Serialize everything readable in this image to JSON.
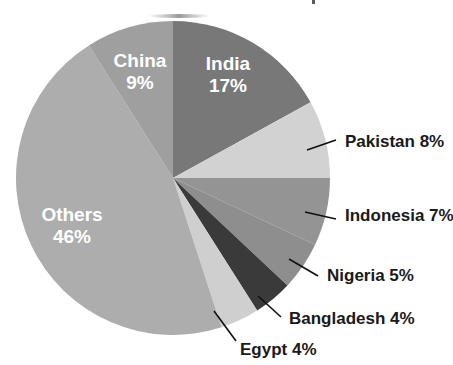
{
  "chart_data": {
    "type": "pie",
    "title": "",
    "xlabel": "",
    "ylabel": "",
    "legend_position": "none",
    "grid": false,
    "units": "percent",
    "start_angle_deg": 0,
    "direction": "clockwise",
    "categories": [
      "India",
      "Pakistan",
      "Indonesia",
      "Nigeria",
      "Bangladesh",
      "Egypt",
      "Others",
      "China"
    ],
    "values": [
      17,
      8,
      7,
      5,
      4,
      4,
      46,
      9
    ],
    "total": 100,
    "slices": [
      {
        "name": "India",
        "value": 17,
        "label": "India",
        "value_label": "17%",
        "color": "#787878",
        "label_placement": "inside",
        "label_color": "#ffffff",
        "start_deg": 0,
        "end_deg": 61.2,
        "leader_line": false
      },
      {
        "name": "Pakistan",
        "value": 8,
        "label": "Pakistan 8%",
        "value_label": "8%",
        "color": "#d2d2d2",
        "label_placement": "outside",
        "label_color": "#1a1a1a",
        "start_deg": 61.2,
        "end_deg": 90.0,
        "leader_line": true
      },
      {
        "name": "Indonesia",
        "value": 7,
        "label": "Indonesia 7%",
        "value_label": "7%",
        "color": "#949494",
        "label_placement": "outside",
        "label_color": "#1a1a1a",
        "start_deg": 90.0,
        "end_deg": 115.2,
        "leader_line": true
      },
      {
        "name": "Nigeria",
        "value": 5,
        "label": "Nigeria 5%",
        "value_label": "5%",
        "color": "#8e8e8e",
        "label_placement": "outside",
        "label_color": "#1a1a1a",
        "start_deg": 115.2,
        "end_deg": 133.2,
        "leader_line": true
      },
      {
        "name": "Bangladesh",
        "value": 4,
        "label": "Bangladesh 4%",
        "value_label": "4%",
        "color": "#3a3a3a",
        "label_placement": "outside",
        "label_color": "#1a1a1a",
        "start_deg": 133.2,
        "end_deg": 147.6,
        "leader_line": true
      },
      {
        "name": "Egypt",
        "value": 4,
        "label": "Egypt 4%",
        "value_label": "4%",
        "color": "#cfcfcf",
        "label_placement": "outside",
        "label_color": "#1a1a1a",
        "start_deg": 147.6,
        "end_deg": 162.0,
        "leader_line": true
      },
      {
        "name": "Others",
        "value": 46,
        "label": "Others",
        "value_label": "46%",
        "color": "#adadad",
        "label_placement": "inside",
        "label_color": "#ffffff",
        "start_deg": 162.0,
        "end_deg": 327.6,
        "leader_line": false
      },
      {
        "name": "China",
        "value": 9,
        "label": "China",
        "value_label": "9%",
        "color": "#9f9f9f",
        "label_placement": "inside",
        "label_color": "#ffffff",
        "start_deg": 327.6,
        "end_deg": 360.0,
        "leader_line": false
      }
    ]
  },
  "inner_labels": [
    {
      "name": "india",
      "line1": "India",
      "line2": "17%",
      "x": 228,
      "y": 65
    },
    {
      "name": "china",
      "line1": "China",
      "line2": "9%",
      "x": 140,
      "y": 62
    },
    {
      "name": "others",
      "line1": "Others",
      "line2": "46%",
      "x": 72,
      "y": 216
    }
  ],
  "outer_labels": [
    {
      "name": "pakistan",
      "text": "Pakistan 8%",
      "text_x": 345,
      "text_y": 143,
      "line_x1": 307,
      "line_y1": 150,
      "line_x2": 336,
      "line_y2": 140
    },
    {
      "name": "indonesia",
      "text": "Indonesia 7%",
      "text_x": 345,
      "text_y": 217,
      "line_x1": 305,
      "line_y1": 212,
      "line_x2": 336,
      "line_y2": 219
    },
    {
      "name": "nigeria",
      "text": "Nigeria 5%",
      "text_x": 327,
      "text_y": 277,
      "line_x1": 289,
      "line_y1": 259,
      "line_x2": 318,
      "line_y2": 276
    },
    {
      "name": "bangladesh",
      "text": "Bangladesh 4%",
      "text_x": 289,
      "text_y": 320,
      "line_x1": 258,
      "line_y1": 296,
      "line_x2": 281,
      "line_y2": 317
    },
    {
      "name": "egypt",
      "text": "Egypt 4%",
      "text_x": 240,
      "text_y": 351,
      "line_x1": 214,
      "line_y1": 311,
      "line_x2": 236,
      "line_y2": 341
    }
  ],
  "geometry": {
    "center_x": 173,
    "center_y": 178,
    "radius": 157
  },
  "colors": {
    "background": "#ffffff",
    "inner_label_text": "#ffffff",
    "outer_label_text": "#1a1a1a",
    "leader_line": "#111111"
  }
}
